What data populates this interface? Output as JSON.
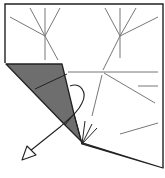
{
  "diagram": {
    "type": "origami-fold-step",
    "colors": {
      "paper": "#ffffff",
      "outline": "#222222",
      "crease": "#777777",
      "folded_flap": "#6e6e6e",
      "arrow_fill": "#ffffff"
    },
    "arrow": {
      "kind": "fold-and-unfold",
      "direction": "down-left"
    },
    "caption": ""
  }
}
